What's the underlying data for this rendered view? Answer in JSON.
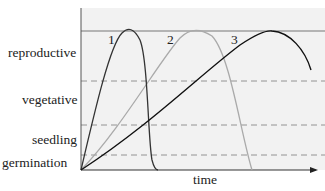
{
  "y_labels": {
    "reproductive": "reproductive",
    "vegetative": "vegetative",
    "seedling": "seedling",
    "germination": "germination"
  },
  "x_label": "time",
  "curve_labels": [
    "1",
    "2",
    "3"
  ],
  "colors": {
    "plot_bg": "#f2f2f2",
    "curve1": "#333333",
    "curve2": "#aaaaaa",
    "curve3": "#111111",
    "dash": "#888888"
  }
}
